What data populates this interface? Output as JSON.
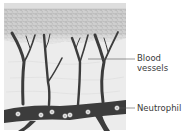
{
  "diagram": {
    "type": "anatomical-cross-section",
    "colors": {
      "background": "#ffffff",
      "epidermis": "#c9c9c9",
      "epidermis_texture": "#a9a9a9",
      "dermis": "#ececec",
      "vessel": "#3c3c3c",
      "cell": "#f4f4f4",
      "leader_line": "#555555",
      "label_text": "#3a3a3a"
    },
    "labels": [
      {
        "id": "blood-vessels",
        "lines": [
          "Blood",
          "vessels"
        ]
      },
      {
        "id": "neutrophil",
        "lines": [
          "Neutrophil"
        ]
      }
    ],
    "neutrophils": [
      {
        "x": 18,
        "y": 114
      },
      {
        "x": 41,
        "y": 115
      },
      {
        "x": 52,
        "y": 112
      },
      {
        "x": 65,
        "y": 116
      },
      {
        "x": 70,
        "y": 115
      },
      {
        "x": 88,
        "y": 112
      },
      {
        "x": 117,
        "y": 108
      }
    ]
  }
}
